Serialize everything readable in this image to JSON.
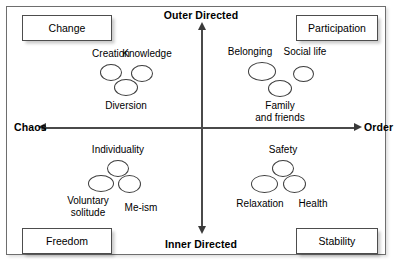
{
  "diagram": {
    "axes": {
      "top_label": "Outer Directed",
      "bottom_label": "Inner Directed",
      "left_label": "Chaos",
      "right_label": "Order"
    },
    "corner_boxes": [
      {
        "key": "top_left",
        "label": "Change"
      },
      {
        "key": "top_right",
        "label": "Participation"
      },
      {
        "key": "bottom_left",
        "label": "Freedom"
      },
      {
        "key": "bottom_right",
        "label": "Stability"
      }
    ],
    "clusters": [
      {
        "quadrant": "top_left",
        "nodes": [
          {
            "label": "Creation"
          },
          {
            "label": "Knowledge"
          },
          {
            "label": "Diversion"
          }
        ]
      },
      {
        "quadrant": "top_right",
        "nodes": [
          {
            "label": "Belonging"
          },
          {
            "label": "Social life"
          },
          {
            "label": "Family\nand friends"
          }
        ]
      },
      {
        "quadrant": "bottom_left",
        "nodes": [
          {
            "label": "Individuality"
          },
          {
            "label": "Voluntary\nsolitude"
          },
          {
            "label": "Me-ism"
          }
        ]
      },
      {
        "quadrant": "bottom_right",
        "nodes": [
          {
            "label": "Safety"
          },
          {
            "label": "Relaxation"
          },
          {
            "label": "Health"
          }
        ]
      }
    ],
    "colors": {
      "axis": "#4a4a4a",
      "arrow": "#3a3a3a",
      "box_border": "#4d4d4d",
      "ellipse_border": "#3d3d3d",
      "text": "#000000",
      "background": "#ffffff"
    }
  },
  "chart_data": {
    "type": "scatter",
    "title": "",
    "xlabel": "Chaos ↔ Order",
    "ylabel": "Inner Directed ↔ Outer Directed",
    "x_axis_low_label": "Chaos",
    "x_axis_high_label": "Order",
    "y_axis_low_label": "Inner Directed",
    "y_axis_high_label": "Outer Directed",
    "grid": false,
    "legend": "none",
    "quadrant_labels": [
      "Change",
      "Participation",
      "Freedom",
      "Stability"
    ],
    "points": [
      {
        "label": "Creation",
        "quadrant": "Change",
        "x": -0.45,
        "y": 0.45
      },
      {
        "label": "Knowledge",
        "quadrant": "Change",
        "x": -0.25,
        "y": 0.44
      },
      {
        "label": "Diversion",
        "quadrant": "Change",
        "x": -0.36,
        "y": 0.33
      },
      {
        "label": "Belonging",
        "quadrant": "Participation",
        "x": 0.28,
        "y": 0.45
      },
      {
        "label": "Social life",
        "quadrant": "Participation",
        "x": 0.56,
        "y": 0.41
      },
      {
        "label": "Family and friends",
        "quadrant": "Participation",
        "x": 0.41,
        "y": 0.31
      },
      {
        "label": "Individuality",
        "quadrant": "Freedom",
        "x": -0.37,
        "y": -0.25
      },
      {
        "label": "Voluntary solitude",
        "quadrant": "Freedom",
        "x": -0.5,
        "y": -0.37
      },
      {
        "label": "Me-ism",
        "quadrant": "Freedom",
        "x": -0.3,
        "y": -0.37
      },
      {
        "label": "Safety",
        "quadrant": "Stability",
        "x": 0.33,
        "y": -0.25
      },
      {
        "label": "Relaxation",
        "quadrant": "Stability",
        "x": 0.2,
        "y": -0.37
      },
      {
        "label": "Health",
        "quadrant": "Stability",
        "x": 0.43,
        "y": -0.37
      }
    ]
  }
}
